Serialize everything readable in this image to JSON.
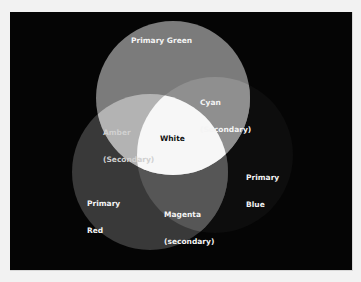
{
  "diagram": {
    "type": "venn",
    "title": "",
    "circles": [
      {
        "id": "green",
        "label": "Primary Green",
        "cx": 173,
        "cy": 98,
        "r": 77,
        "fill": "#7a7a7a"
      },
      {
        "id": "red",
        "label": "Primary Red",
        "cx": 150,
        "cy": 172,
        "r": 78,
        "fill": "#3a3a3a"
      },
      {
        "id": "blue",
        "label": "Primary Blue",
        "cx": 215,
        "cy": 155,
        "r": 78,
        "fill": "#0c0c0c"
      }
    ],
    "regions": [
      {
        "id": "cyan",
        "label_line1": "Cyan",
        "label_line2": "(Secondary)",
        "fill": "#8e8e8e"
      },
      {
        "id": "amber",
        "label_line1": "Amber",
        "label_line2": "(Secondary)",
        "fill": "#b4b4b4"
      },
      {
        "id": "magenta",
        "label_line1": "Magenta",
        "label_line2": "(secondary)",
        "fill": "#555555"
      },
      {
        "id": "white",
        "label_line1": "White",
        "fill": "#f7f7f7"
      }
    ],
    "labels": {
      "primary_green": "Primary Green",
      "primary_red_1": "Primary",
      "primary_red_2": "Red",
      "primary_blue_1": "Primary",
      "primary_blue_2": "Blue",
      "cyan_1": "Cyan",
      "cyan_2": "(Secondary)",
      "amber_1": "Amber",
      "amber_2": "(Secondary)",
      "magenta_1": "Magenta",
      "magenta_2": "(secondary)",
      "white": "White"
    },
    "colors": {
      "background": "#050505",
      "page": "#f2f2f2"
    }
  }
}
